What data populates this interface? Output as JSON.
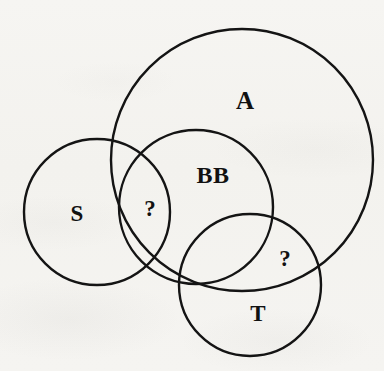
{
  "figure": {
    "type": "venn-diagram",
    "background_color": "#f4f3f0",
    "stroke_color": "#141414",
    "text_color": "#111111",
    "width": 384,
    "height": 371
  },
  "sets": [
    {
      "id": "A",
      "label": "A",
      "cx": 242,
      "cy": 160,
      "r": 131,
      "stroke_width": 2.4,
      "label_x": 245,
      "label_y": 100
    },
    {
      "id": "S",
      "label": "S",
      "cx": 97,
      "cy": 212,
      "r": 73,
      "stroke_width": 2.4,
      "label_x": 77,
      "label_y": 213
    },
    {
      "id": "BB",
      "label": "BB",
      "cx": 196,
      "cy": 207,
      "r": 77,
      "stroke_width": 2.4,
      "label_x": 213,
      "label_y": 175
    },
    {
      "id": "T",
      "label": "T",
      "cx": 250,
      "cy": 285,
      "r": 71,
      "stroke_width": 2.4,
      "label_x": 258,
      "label_y": 313
    }
  ],
  "annotations": [
    {
      "id": "q-s-bb",
      "label": "?",
      "region": "S ∩ BB",
      "x": 150,
      "y": 208
    },
    {
      "id": "q-a-t",
      "label": "?",
      "region": "A ∩ T",
      "x": 285,
      "y": 258
    }
  ]
}
